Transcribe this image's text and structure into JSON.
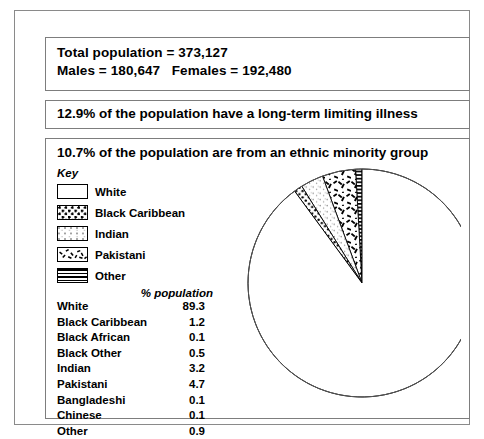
{
  "panels": {
    "population": {
      "line1": "Total population = 373,127",
      "line2": "Males = 180,647   Females = 192,480"
    },
    "illness": {
      "text": "12.9% of the population have a long-term limiting illness"
    },
    "ethnic": {
      "heading": "10.7% of the population are from an ethnic minority group",
      "key_title": "Key",
      "key": [
        {
          "label": "White",
          "pattern": "white"
        },
        {
          "label": "Black Caribbean",
          "pattern": "blackcaribbean"
        },
        {
          "label": "Indian",
          "pattern": "indian"
        },
        {
          "label": "Pakistani",
          "pattern": "pakistani"
        },
        {
          "label": "Other",
          "pattern": "other"
        }
      ],
      "table_header": "% population",
      "table": [
        {
          "category": "White",
          "value": "89.3"
        },
        {
          "category": "Black Caribbean",
          "value": "1.2"
        },
        {
          "category": "Black African",
          "value": "0.1"
        },
        {
          "category": "Black Other",
          "value": "0.5"
        },
        {
          "category": "Indian",
          "value": "3.2"
        },
        {
          "category": "Pakistani",
          "value": "4.7"
        },
        {
          "category": "Bangladeshi",
          "value": "0.1"
        },
        {
          "category": "Chinese",
          "value": "0.1"
        },
        {
          "category": "Other",
          "value": "0.9"
        }
      ]
    }
  },
  "chart_data": {
    "type": "pie",
    "title": "10.7% of the population are from an ethnic minority group",
    "unit": "% population",
    "direction": "counter-clockwise from 12 o'clock",
    "legend_position": "left",
    "categories": [
      "White",
      "Black Caribbean",
      "Indian",
      "Pakistani",
      "Other"
    ],
    "values": [
      89.3,
      1.2,
      3.2,
      4.7,
      0.9
    ],
    "slice_patterns": [
      "white",
      "dense-dots",
      "light-dots",
      "dashes",
      "horizontal-lines"
    ],
    "table_categories": [
      "White",
      "Black Caribbean",
      "Black African",
      "Black Other",
      "Indian",
      "Pakistani",
      "Bangladeshi",
      "Chinese",
      "Other"
    ],
    "table_values": [
      89.3,
      1.2,
      0.1,
      0.5,
      3.2,
      4.7,
      0.1,
      0.1,
      0.9
    ],
    "total_population": 373127,
    "males": 180647,
    "females": 192480,
    "long_term_illness_pct": 12.9,
    "ethnic_minority_pct": 10.7,
    "colors": {
      "stroke": "#000000",
      "background": "#ffffff"
    }
  }
}
